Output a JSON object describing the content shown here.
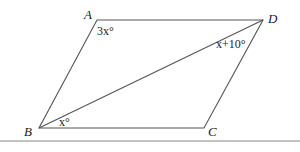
{
  "diagram": {
    "vertices": {
      "A": {
        "label": "A",
        "x": 97,
        "y": 20
      },
      "B": {
        "label": "B",
        "x": 39,
        "y": 128
      },
      "C": {
        "label": "C",
        "x": 204,
        "y": 128
      },
      "D": {
        "label": "D",
        "x": 263,
        "y": 20
      }
    },
    "angles": {
      "A": "3x°",
      "D": "x+10°",
      "B": "x°"
    },
    "line_color": "#555555"
  }
}
